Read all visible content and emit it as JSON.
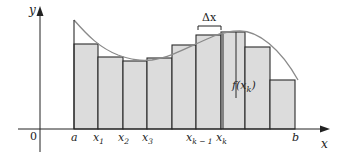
{
  "diagram": {
    "colors": {
      "rect_fill": "#dcdcdc",
      "rect_stroke": "#2a2a2a",
      "curve": "#8a8a8a",
      "axis": "#222222"
    },
    "axes": {
      "x_label": "x",
      "y_label": "y",
      "origin_label": "0"
    },
    "tick_labels": [
      {
        "text": "a",
        "sub": "",
        "x": 74
      },
      {
        "text": "x",
        "sub": "1",
        "x": 98
      },
      {
        "text": "x",
        "sub": "2",
        "x": 123
      },
      {
        "text": "x",
        "sub": "3",
        "x": 147
      },
      {
        "text": "x",
        "sub": "k − 1",
        "x": 196
      },
      {
        "text": "x",
        "sub": "k",
        "x": 221
      },
      {
        "text": "b",
        "sub": "",
        "x": 295
      }
    ],
    "annotations": {
      "delta_x": "Δx",
      "f_xk": "f(x",
      "f_xk_sub": "k",
      "f_xk_close": ")"
    },
    "rectangles": [
      {
        "x0": 74,
        "x1": 98,
        "top": 44
      },
      {
        "x0": 98,
        "x1": 123,
        "top": 57
      },
      {
        "x0": 123,
        "x1": 147,
        "top": 61
      },
      {
        "x0": 147,
        "x1": 172,
        "top": 58
      },
      {
        "x0": 172,
        "x1": 196,
        "top": 45
      },
      {
        "x0": 196,
        "x1": 221,
        "top": 35
      },
      {
        "x0": 221,
        "x1": 245,
        "top": 32
      },
      {
        "x0": 245,
        "x1": 270,
        "top": 47
      },
      {
        "x0": 270,
        "x1": 295,
        "top": 80
      }
    ]
  }
}
